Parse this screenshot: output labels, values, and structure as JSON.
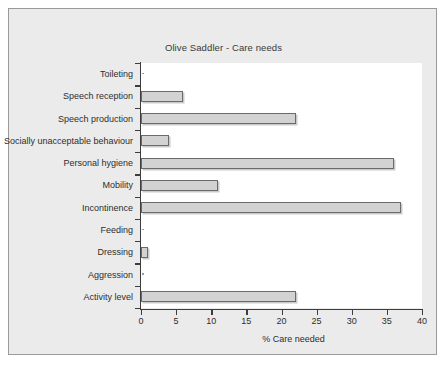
{
  "chart_data": {
    "type": "bar",
    "orientation": "horizontal",
    "title": "Olive Saddler - Care needs",
    "xlabel": "% Care needed",
    "ylabel": "",
    "xlim": [
      0,
      40
    ],
    "xticks": [
      0,
      5,
      10,
      15,
      20,
      25,
      30,
      35,
      40
    ],
    "grid": false,
    "legend": null,
    "categories": [
      "Toileting",
      "Speech reception",
      "Speech production",
      "Socially unacceptable behaviour",
      "Personal hygiene",
      "Mobility",
      "Incontinence",
      "Feeding",
      "Dressing",
      "Aggression",
      "Activity level"
    ],
    "values": [
      0,
      6,
      22,
      4,
      36,
      11,
      37,
      0,
      1,
      0,
      22
    ],
    "bar_fill_color": "#d2d2d2",
    "bar_edge_color": "#6a6a6a",
    "plot_background": "#ffffff",
    "figure_background": "#ebebeb"
  },
  "figure": {
    "frame_border_color": "#9a9a9a"
  }
}
